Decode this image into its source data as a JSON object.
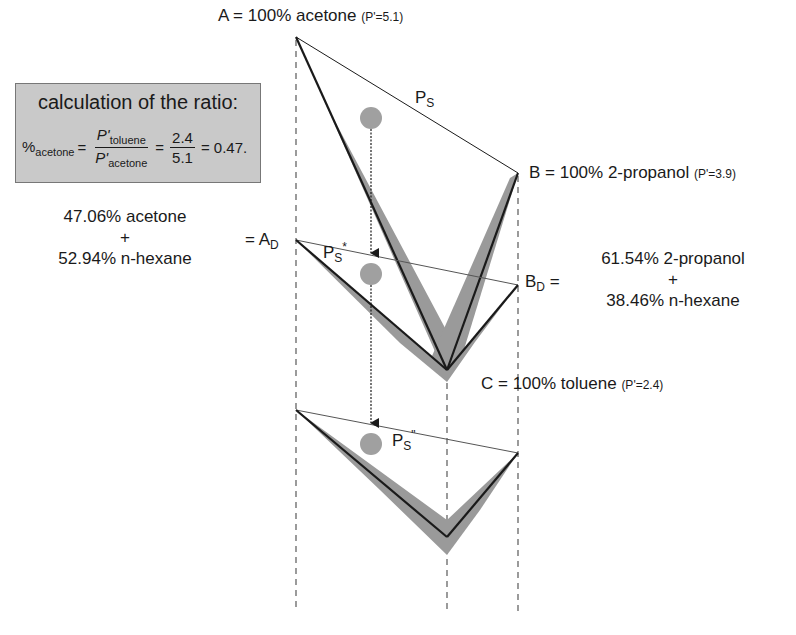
{
  "calculation_box": {
    "title": "calculation of the ratio:",
    "lhs_prefix": "%",
    "lhs_sub": "acetone",
    "eq1": "=",
    "num_var": "P'",
    "num_sub": "toluene",
    "den_var": "P'",
    "den_sub": "acetone",
    "eq2": "=",
    "num_val": "2.4",
    "den_val": "5.1",
    "result": "= 0.47."
  },
  "vertices": {
    "A": {
      "label": "A = 100% acetone",
      "polarity": "(P'=5.1)"
    },
    "B": {
      "label": "B = 100% 2-propanol",
      "polarity": "(P'=3.9)"
    },
    "C": {
      "label": "C = 100% toluene",
      "polarity": "(P'=2.4)"
    }
  },
  "mixtures": {
    "AD": {
      "prefix": "= A",
      "sub": "D",
      "line1": "47.06% acetone",
      "plus": "+",
      "line2": "52.94% n-hexane"
    },
    "BD": {
      "prefix": "B",
      "sub": "D",
      "suffix": " =",
      "line1": "61.54% 2-propanol",
      "plus": "+",
      "line2": "38.46% n-hexane"
    }
  },
  "solvent_points": {
    "PS": {
      "main": "P",
      "sub": "S",
      "sup": ""
    },
    "PS_star": {
      "main": "P",
      "sub": "S",
      "sup": "*"
    },
    "PS_dstar": {
      "main": "P",
      "sub": "S",
      "sup": "\""
    }
  },
  "colors": {
    "line": "#1a1a1a",
    "band": "#9a9a9a",
    "circle": "#a0a0a0",
    "dashed": "#666666",
    "box_fill": "#c9c9c9"
  }
}
